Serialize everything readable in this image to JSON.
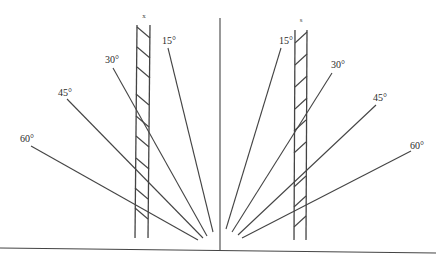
{
  "diagram": {
    "left_bar": {
      "label": "x"
    },
    "right_bar": {
      "label": "s"
    },
    "left_angles": [
      "15°",
      "30°",
      "45°",
      "60°"
    ],
    "right_angles": [
      "15°",
      "30°",
      "45°",
      "60°"
    ],
    "colors": {
      "line": "#444444",
      "background": "#ffffff",
      "text": "#2a2a2a"
    }
  }
}
